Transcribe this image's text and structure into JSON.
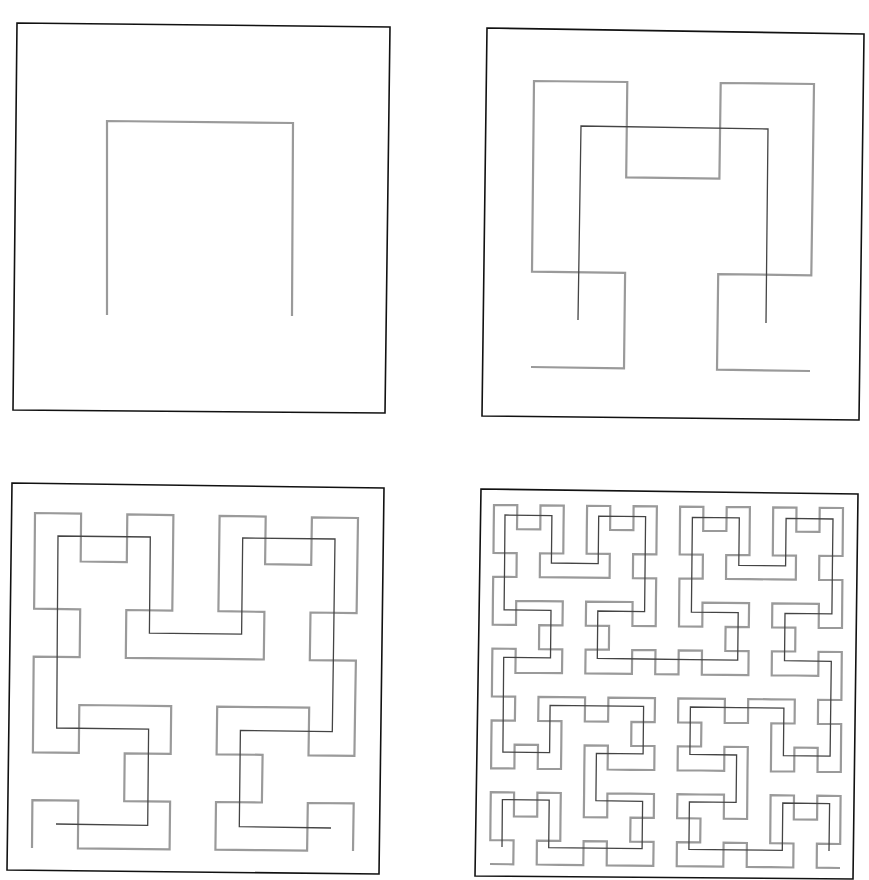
{
  "figure": {
    "colors": {
      "background": "#ffffff",
      "frame": "#111111",
      "current_order": "#9a9a9a",
      "previous_order": "#444444"
    },
    "panels": [
      {
        "id": "panel-order-1",
        "frame": {
          "tl": [
            17,
            23
          ],
          "tr": [
            390,
            27
          ],
          "br": [
            385,
            413
          ],
          "bl": [
            13,
            410
          ]
        },
        "curves": [
          {
            "role": "current",
            "order": 1,
            "color": "#9a9a9a",
            "width": 2.2,
            "corners": {
              "bl": [
                107,
                315
              ],
              "br": [
                292,
                316
              ],
              "tl": [
                107,
                121
              ],
              "tr": [
                293,
                123
              ]
            }
          }
        ]
      },
      {
        "id": "panel-order-2",
        "frame": {
          "tl": [
            487,
            28
          ],
          "tr": [
            864,
            34
          ],
          "br": [
            859,
            420
          ],
          "bl": [
            482,
            416
          ]
        },
        "curves": [
          {
            "role": "current",
            "order": 2,
            "color": "#9a9a9a",
            "width": 2.2,
            "corners": {
              "bl": [
                531,
                367
              ],
              "br": [
                810,
                371
              ],
              "tl": [
                534,
                81
              ],
              "tr": [
                814,
                84
              ]
            }
          },
          {
            "role": "previous",
            "order": 1,
            "color": "#444444",
            "width": 1.3,
            "corners": {
              "bl": [
                578,
                320
              ],
              "br": [
                766,
                323
              ],
              "tl": [
                581,
                126
              ],
              "tr": [
                768,
                129
              ]
            }
          }
        ]
      },
      {
        "id": "panel-order-3",
        "frame": {
          "tl": [
            12,
            483
          ],
          "tr": [
            384,
            488
          ],
          "br": [
            379,
            874
          ],
          "bl": [
            7,
            870
          ]
        },
        "curves": [
          {
            "role": "current",
            "order": 3,
            "color": "#9a9a9a",
            "width": 2.2,
            "corners": {
              "bl": [
                32,
                848
              ],
              "br": [
                353,
                851
              ],
              "tl": [
                35,
                513
              ],
              "tr": [
                358,
                518
              ]
            }
          },
          {
            "role": "previous",
            "order": 2,
            "color": "#444444",
            "width": 1.3,
            "corners": {
              "bl": [
                56,
                824
              ],
              "br": [
                331,
                828
              ],
              "tl": [
                58,
                536
              ],
              "tr": [
                335,
                539
              ]
            }
          }
        ]
      },
      {
        "id": "panel-order-4",
        "frame": {
          "tl": [
            481,
            489
          ],
          "tr": [
            858,
            494
          ],
          "br": [
            853,
            879
          ],
          "bl": [
            475,
            876
          ]
        },
        "curves": [
          {
            "role": "current",
            "order": 4,
            "color": "#9a9a9a",
            "width": 2.2,
            "corners": {
              "bl": [
                490,
                864
              ],
              "br": [
                840,
                868
              ],
              "tl": [
                494,
                505
              ],
              "tr": [
                843,
                508
              ]
            }
          },
          {
            "role": "previous",
            "order": 3,
            "color": "#444444",
            "width": 1.3,
            "corners": {
              "bl": [
                502,
                847
              ],
              "br": [
                829,
                851
              ],
              "tl": [
                505,
                515
              ],
              "tr": [
                833,
                519
              ]
            }
          }
        ]
      }
    ]
  }
}
